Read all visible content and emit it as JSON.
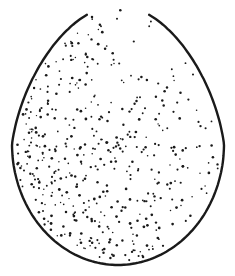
{
  "figure": {
    "colors": {
      "background": "#ffffff",
      "ink": "#1a1a1a"
    },
    "egg": {
      "cx": 118,
      "cy": 144,
      "rx": 106,
      "ry_bottom": 121,
      "ry_top": 138
    }
  }
}
